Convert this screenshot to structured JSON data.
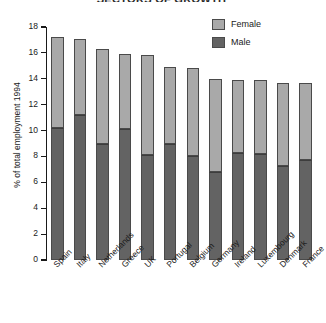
{
  "chart_data": {
    "type": "bar",
    "subtype": "stacked",
    "title": "SECTORS OF GROWTH",
    "xlabel": "",
    "ylabel": "% of total employment 1994",
    "ylim": [
      0,
      18
    ],
    "ytick_step": 2,
    "yticks": [
      0,
      2,
      4,
      6,
      8,
      10,
      12,
      14,
      16,
      18
    ],
    "grid": false,
    "legend_position": "top-right",
    "categories": [
      "Spain",
      "Italy",
      "Netherlands",
      "Greece",
      "UK",
      "Portugal",
      "Belgium",
      "Germany",
      "Ireland",
      "Luxembourg",
      "Denmark",
      "France"
    ],
    "series": [
      {
        "name": "Male",
        "color": "#636363",
        "values": [
          10.2,
          11.2,
          9.0,
          10.1,
          8.1,
          9.0,
          8.0,
          6.8,
          8.3,
          8.2,
          7.3,
          7.7
        ]
      },
      {
        "name": "Female",
        "color": "#a9a9a9",
        "values": [
          7.0,
          5.9,
          7.3,
          5.8,
          7.7,
          5.9,
          6.8,
          7.2,
          5.6,
          5.7,
          6.4,
          6.0
        ]
      }
    ],
    "totals": [
      17.2,
      17.1,
      16.3,
      15.9,
      15.8,
      14.9,
      14.8,
      14.0,
      13.9,
      13.9,
      13.7,
      13.7
    ]
  },
  "legend": {
    "items": [
      {
        "label": "Female",
        "swatch": "female"
      },
      {
        "label": "Male",
        "swatch": "male"
      }
    ]
  }
}
